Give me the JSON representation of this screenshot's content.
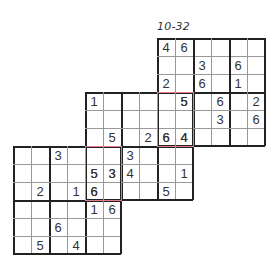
{
  "title": "10-32",
  "colors": {
    "thick_line": "#222222",
    "thin_line": "#999999",
    "overlap_highlight": "#e57a8a",
    "digit": "#333333"
  },
  "grids": [
    {
      "name": "top-right",
      "left": 157,
      "top": 38,
      "rows": [
        [
          "4",
          "6",
          "",
          "",
          "",
          ""
        ],
        [
          "",
          "",
          "3",
          "",
          "6",
          ""
        ],
        [
          "2",
          "",
          "6",
          "",
          "1",
          ""
        ],
        [
          "",
          "5",
          "",
          "6",
          "",
          "2"
        ],
        [
          "",
          "",
          "",
          "3",
          "",
          "6"
        ],
        [
          "6",
          "4",
          "",
          "",
          "",
          ""
        ]
      ]
    },
    {
      "name": "middle",
      "left": 85,
      "top": 92,
      "rows": [
        [
          "1",
          "",
          "",
          "",
          "",
          "5"
        ],
        [
          "",
          "",
          "",
          "",
          "",
          ""
        ],
        [
          "",
          "5",
          "",
          "2",
          "6",
          "4"
        ],
        [
          "",
          "",
          "3",
          "",
          "",
          ""
        ],
        [
          "5",
          "3",
          "4",
          "",
          "",
          "1"
        ],
        [
          "6",
          "",
          "",
          "",
          "5",
          ""
        ]
      ]
    },
    {
      "name": "bottom-left",
      "left": 13,
      "top": 146,
      "rows": [
        [
          "",
          "",
          "3",
          "",
          "",
          ""
        ],
        [
          "",
          "",
          "",
          "",
          "5",
          "3"
        ],
        [
          "",
          "2",
          "",
          "1",
          "6",
          ""
        ],
        [
          "",
          "",
          "",
          "",
          "1",
          "6"
        ],
        [
          "",
          "",
          "6",
          "",
          "",
          ""
        ],
        [
          "",
          "5",
          "",
          "4",
          "",
          ""
        ]
      ]
    }
  ],
  "overlaps": [
    {
      "name": "overlap-top-middle",
      "left": 157,
      "top": 92,
      "width": 36,
      "height": 54
    },
    {
      "name": "overlap-middle-bottom",
      "left": 85,
      "top": 146,
      "width": 36,
      "height": 54
    }
  ]
}
